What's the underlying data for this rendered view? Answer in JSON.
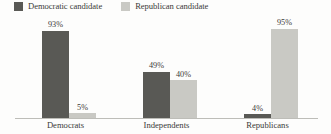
{
  "chart_data": {
    "type": "bar",
    "title": "",
    "subtitle": "",
    "xlabel": "",
    "ylabel": "",
    "ylim": [
      0,
      100
    ],
    "grid": false,
    "legend_position": "top-left",
    "categories": [
      "Democrats",
      "Independents",
      "Republicans"
    ],
    "series": [
      {
        "name": "Democratic candidate",
        "color": "#595955",
        "values": [
          93,
          49,
          4
        ],
        "value_labels": [
          "93%",
          "49%",
          "4%"
        ]
      },
      {
        "name": "Republican candidate",
        "color": "#c9c9c4",
        "values": [
          5,
          40,
          95
        ],
        "value_labels": [
          "5%",
          "40%",
          "95%"
        ]
      }
    ]
  },
  "legend": {
    "entries": [
      {
        "label": "Democratic candidate",
        "color": "#595955"
      },
      {
        "label": "Republican candidate",
        "color": "#c9c9c4"
      }
    ]
  },
  "axis": {
    "baseline_color": "#bdbdb8"
  }
}
